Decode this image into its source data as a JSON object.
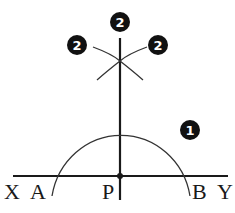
{
  "diagram": {
    "colors": {
      "stroke": "#1a1a1a",
      "background": "#ffffff",
      "badge_fill": "#111111",
      "badge_text": "#ffffff"
    },
    "line": {
      "name": "XY",
      "start_label": "X",
      "end_label": "Y"
    },
    "points": [
      {
        "id": "X",
        "label": "X"
      },
      {
        "id": "A",
        "label": "A"
      },
      {
        "id": "P",
        "label": "P"
      },
      {
        "id": "B",
        "label": "B"
      },
      {
        "id": "Y",
        "label": "Y"
      }
    ],
    "steps": [
      {
        "number": "1",
        "description": "Arc centered at P cutting XY at A and B"
      },
      {
        "number": "2",
        "description": "Arcs from A and B intersecting above P"
      }
    ],
    "badges": {
      "step1": "1",
      "step2_top": "2",
      "step2_left": "2",
      "step2_right": "2"
    }
  }
}
